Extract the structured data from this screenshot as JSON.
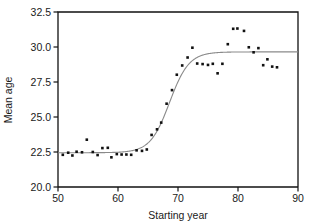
{
  "chart_data": {
    "type": "scatter",
    "title": "",
    "xlabel": "Starting year",
    "ylabel": "Mean age",
    "xlim": [
      50,
      90
    ],
    "ylim": [
      20.0,
      32.5
    ],
    "xticks": [
      50,
      60,
      70,
      80,
      90
    ],
    "xtick_labels": [
      "50",
      "60",
      "70",
      "80",
      "90"
    ],
    "yticks": [
      20.0,
      22.5,
      25.0,
      27.5,
      30.0,
      32.5
    ],
    "ytick_labels": [
      "20.0",
      "22.5",
      "25.0",
      "27.5",
      "30.0",
      "32.5"
    ],
    "grid": false,
    "legend": "none",
    "marker": "filled-square",
    "marker_color": "#111111",
    "marker_size": 2.6,
    "frame_color": "#111111",
    "series": [
      {
        "name": "Mean age observations",
        "type": "scatter",
        "points": [
          [
            50.8,
            22.3
          ],
          [
            51.7,
            22.45
          ],
          [
            52.4,
            22.25
          ],
          [
            53.1,
            22.52
          ],
          [
            54.0,
            22.48
          ],
          [
            54.8,
            23.38
          ],
          [
            55.8,
            22.5
          ],
          [
            56.6,
            22.28
          ],
          [
            57.4,
            22.78
          ],
          [
            58.3,
            22.8
          ],
          [
            58.9,
            22.12
          ],
          [
            59.8,
            22.35
          ],
          [
            60.6,
            22.32
          ],
          [
            61.4,
            22.32
          ],
          [
            62.2,
            22.3
          ],
          [
            63.1,
            22.62
          ],
          [
            64.0,
            22.58
          ],
          [
            64.8,
            22.68
          ],
          [
            65.6,
            23.72
          ],
          [
            66.5,
            24.12
          ],
          [
            67.2,
            24.6
          ],
          [
            68.1,
            25.95
          ],
          [
            69.0,
            26.92
          ],
          [
            69.8,
            28.02
          ],
          [
            70.7,
            28.68
          ],
          [
            71.6,
            29.25
          ],
          [
            72.4,
            29.95
          ],
          [
            73.2,
            28.82
          ],
          [
            74.1,
            28.78
          ],
          [
            75.0,
            28.72
          ],
          [
            75.8,
            28.8
          ],
          [
            76.6,
            28.12
          ],
          [
            77.4,
            28.8
          ],
          [
            78.3,
            30.2
          ],
          [
            79.2,
            31.3
          ],
          [
            79.9,
            31.32
          ],
          [
            81.0,
            31.15
          ],
          [
            81.8,
            29.98
          ],
          [
            82.6,
            29.62
          ],
          [
            83.4,
            29.92
          ],
          [
            84.2,
            28.7
          ],
          [
            84.9,
            29.12
          ],
          [
            85.7,
            28.6
          ],
          [
            86.5,
            28.55
          ]
        ]
      },
      {
        "name": "Fitted logistic curve",
        "type": "line",
        "color": "#8a8a8a",
        "lower_asymptote": 22.45,
        "upper_asymptote": 29.65,
        "midpoint_year": 68.6,
        "growth_rate": 0.62
      }
    ]
  },
  "figure": {
    "background": "#ffffff",
    "plot_left_px": 58,
    "plot_right_px": 298,
    "plot_top_px": 12,
    "plot_bottom_px": 187
  }
}
